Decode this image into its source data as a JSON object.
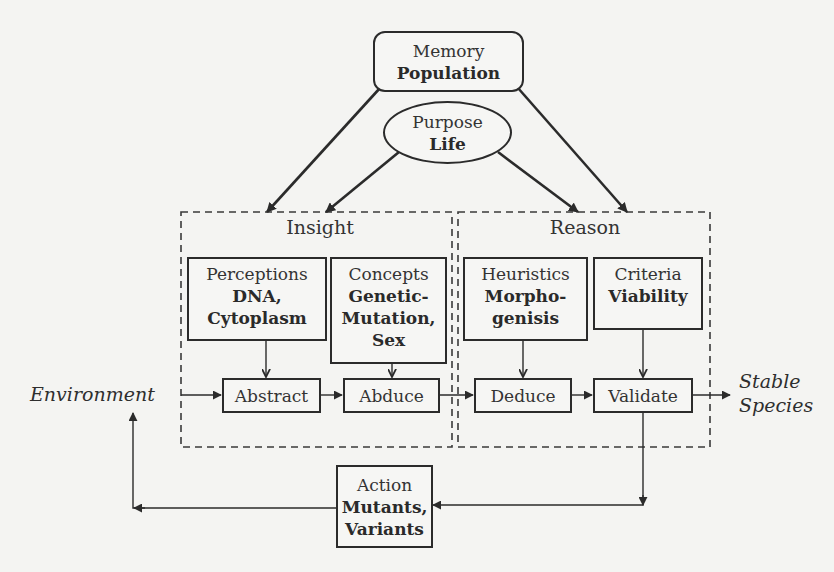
{
  "diagram": {
    "type": "flowchart",
    "nodes": {
      "memory": {
        "title": "Memory",
        "subtitle": "Population"
      },
      "purpose": {
        "title": "Purpose",
        "subtitle": "Life"
      },
      "perceptions": {
        "title": "Perceptions",
        "subtitle": "DNA,\nCytoplasm"
      },
      "concepts": {
        "title": "Concepts",
        "subtitle": "Genetic-\nMutation,\nSex"
      },
      "heuristics": {
        "title": "Heuristics",
        "subtitle": "Morpho-\ngenisis"
      },
      "criteria": {
        "title": "Criteria",
        "subtitle": "Viability"
      },
      "abstract": {
        "label": "Abstract"
      },
      "abduce": {
        "label": "Abduce"
      },
      "deduce": {
        "label": "Deduce"
      },
      "validate": {
        "label": "Validate"
      },
      "action": {
        "title": "Action",
        "subtitle": "Mutants,\nVariants"
      }
    },
    "groups": {
      "insight": {
        "label": "Insight"
      },
      "reason": {
        "label": "Reason"
      }
    },
    "external": {
      "environment": "Environment",
      "stable_species": "Stable\nSpecies"
    },
    "edges": [
      {
        "from": "memory",
        "to": "insight"
      },
      {
        "from": "memory",
        "to": "reason"
      },
      {
        "from": "purpose",
        "to": "insight"
      },
      {
        "from": "purpose",
        "to": "reason"
      },
      {
        "from": "perceptions",
        "to": "abstract"
      },
      {
        "from": "concepts",
        "to": "abduce"
      },
      {
        "from": "heuristics",
        "to": "deduce"
      },
      {
        "from": "criteria",
        "to": "validate"
      },
      {
        "from": "environment",
        "to": "abstract"
      },
      {
        "from": "abstract",
        "to": "abduce"
      },
      {
        "from": "abduce",
        "to": "deduce"
      },
      {
        "from": "deduce",
        "to": "validate"
      },
      {
        "from": "validate",
        "to": "stable_species"
      },
      {
        "from": "validate",
        "to": "action"
      },
      {
        "from": "action",
        "to": "environment"
      }
    ],
    "colors": {
      "line": "#2b2b2b",
      "background": "#f4f4f2"
    }
  }
}
